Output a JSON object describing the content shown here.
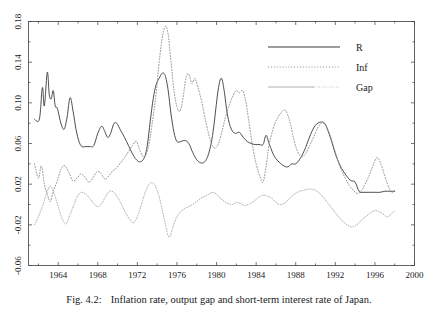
{
  "caption": {
    "number": "Fig. 4.2:",
    "text": "Inflation rate, output gap and short-term interest rate of Japan."
  },
  "legend": {
    "position": "top-right",
    "items": [
      {
        "label": "R",
        "style": "solid",
        "color": "#3a3a3a"
      },
      {
        "label": "Inf",
        "style": "dotted",
        "color": "#8c8c8c"
      },
      {
        "label": "Gap",
        "style": "solid-dotted",
        "color": "#b0b0b0"
      }
    ]
  },
  "chart_data": {
    "type": "line",
    "title": "",
    "xlabel": "",
    "ylabel": "",
    "xlim": [
      1961.0,
      2000.0
    ],
    "ylim": [
      -0.06,
      0.18
    ],
    "grid": false,
    "legend_position": "top-right",
    "xticks": [
      1964,
      1968,
      1972,
      1976,
      1980,
      1984,
      1988,
      1992,
      1996,
      2000
    ],
    "xtick_labels": [
      "1964",
      "1968",
      "1972",
      "1976",
      "1980",
      "1984",
      "1988",
      "1992",
      "1996",
      "2000"
    ],
    "yticks": [
      -0.06,
      -0.02,
      0.02,
      0.06,
      0.1,
      0.14,
      0.18
    ],
    "ytick_labels": [
      "-0.06",
      "-0.02",
      "0.02",
      "0.06",
      "0.10",
      "0.14",
      "0.18"
    ],
    "series": [
      {
        "name": "R",
        "style": "solid",
        "color": "#3a3a3a",
        "x": [
          1961.6,
          1962.1,
          1962.4,
          1962.6,
          1962.9,
          1963.1,
          1963.3,
          1963.5,
          1963.7,
          1963.9,
          1964.1,
          1964.3,
          1964.6,
          1964.9,
          1965.2,
          1965.5,
          1965.8,
          1966.1,
          1966.4,
          1966.8,
          1967.2,
          1967.6,
          1968.0,
          1968.4,
          1968.7,
          1969.0,
          1969.3,
          1969.6,
          1969.9,
          1970.3,
          1970.7,
          1971.1,
          1971.5,
          1971.9,
          1972.3,
          1972.7,
          1973.0,
          1973.3,
          1973.6,
          1973.9,
          1974.2,
          1974.5,
          1974.8,
          1975.1,
          1975.4,
          1975.7,
          1976.0,
          1976.4,
          1976.8,
          1977.2,
          1977.6,
          1978.0,
          1978.4,
          1978.8,
          1979.2,
          1979.6,
          1979.9,
          1980.2,
          1980.5,
          1980.8,
          1981.1,
          1981.5,
          1981.9,
          1982.3,
          1982.7,
          1983.1,
          1983.5,
          1983.9,
          1984.3,
          1984.7,
          1985.0,
          1985.3,
          1985.5,
          1985.7,
          1986.0,
          1986.4,
          1986.8,
          1987.2,
          1987.6,
          1988.0,
          1988.5,
          1989.0,
          1989.5,
          1990.0,
          1990.5,
          1990.9,
          1991.2,
          1991.6,
          1992.0,
          1992.5,
          1993.0,
          1993.5,
          1994.0,
          1994.4,
          1994.8,
          1995.2,
          1995.6,
          1996.0,
          1996.5,
          1997.0,
          1997.5,
          1998.0
        ],
        "y": [
          0.084,
          0.084,
          0.115,
          0.097,
          0.13,
          0.108,
          0.104,
          0.112,
          0.097,
          0.095,
          0.087,
          0.079,
          0.074,
          0.086,
          0.105,
          0.092,
          0.074,
          0.062,
          0.057,
          0.057,
          0.057,
          0.058,
          0.07,
          0.077,
          0.072,
          0.066,
          0.07,
          0.079,
          0.08,
          0.073,
          0.066,
          0.058,
          0.05,
          0.044,
          0.042,
          0.046,
          0.058,
          0.082,
          0.104,
          0.118,
          0.124,
          0.129,
          0.127,
          0.113,
          0.089,
          0.071,
          0.062,
          0.062,
          0.063,
          0.06,
          0.051,
          0.044,
          0.041,
          0.042,
          0.05,
          0.068,
          0.092,
          0.115,
          0.124,
          0.11,
          0.088,
          0.074,
          0.07,
          0.071,
          0.066,
          0.062,
          0.06,
          0.059,
          0.059,
          0.059,
          0.068,
          0.06,
          0.055,
          0.05,
          0.045,
          0.041,
          0.038,
          0.037,
          0.04,
          0.04,
          0.046,
          0.056,
          0.069,
          0.078,
          0.081,
          0.08,
          0.074,
          0.063,
          0.05,
          0.038,
          0.03,
          0.024,
          0.022,
          0.013,
          0.012,
          0.012,
          0.012,
          0.012,
          0.012,
          0.013,
          0.013,
          0.013
        ]
      },
      {
        "name": "Inf",
        "style": "dotted",
        "color": "#8c8c8c",
        "x": [
          1961.6,
          1962.0,
          1962.3,
          1962.6,
          1962.9,
          1963.2,
          1963.5,
          1963.9,
          1964.3,
          1964.7,
          1965.1,
          1965.5,
          1965.9,
          1966.3,
          1966.7,
          1967.1,
          1967.5,
          1967.9,
          1968.3,
          1968.7,
          1969.1,
          1969.5,
          1969.9,
          1970.3,
          1970.7,
          1971.1,
          1971.5,
          1971.9,
          1972.3,
          1972.7,
          1973.1,
          1973.5,
          1973.9,
          1974.2,
          1974.5,
          1974.8,
          1975.1,
          1975.4,
          1975.7,
          1976.0,
          1976.3,
          1976.6,
          1976.9,
          1977.2,
          1977.5,
          1977.8,
          1978.1,
          1978.5,
          1978.9,
          1979.3,
          1979.7,
          1980.1,
          1980.5,
          1980.9,
          1981.3,
          1981.7,
          1982.0,
          1982.3,
          1982.6,
          1982.9,
          1983.2,
          1983.6,
          1984.0,
          1984.4,
          1984.7,
          1985.0,
          1985.3,
          1985.7,
          1986.1,
          1986.5,
          1986.9,
          1987.2,
          1987.5,
          1987.8,
          1988.2,
          1988.6,
          1989.0,
          1989.4,
          1989.8,
          1990.2,
          1990.6,
          1991.0,
          1991.4,
          1991.8,
          1992.2,
          1992.6,
          1993.0,
          1993.4,
          1993.8,
          1994.2,
          1994.6,
          1995.0,
          1995.4,
          1995.8,
          1996.2,
          1996.6,
          1997.0,
          1997.4,
          1997.7,
          1998.0
        ],
        "y": [
          0.04,
          0.026,
          0.038,
          0.02,
          0.01,
          0.003,
          0.013,
          0.023,
          0.035,
          0.038,
          0.031,
          0.023,
          0.026,
          0.03,
          0.027,
          0.022,
          0.026,
          0.032,
          0.031,
          0.025,
          0.028,
          0.033,
          0.036,
          0.041,
          0.046,
          0.052,
          0.058,
          0.062,
          0.052,
          0.047,
          0.056,
          0.08,
          0.11,
          0.14,
          0.163,
          0.175,
          0.168,
          0.14,
          0.112,
          0.096,
          0.092,
          0.104,
          0.124,
          0.128,
          0.119,
          0.124,
          0.116,
          0.101,
          0.082,
          0.066,
          0.056,
          0.058,
          0.07,
          0.086,
          0.098,
          0.108,
          0.112,
          0.11,
          0.112,
          0.104,
          0.086,
          0.06,
          0.04,
          0.027,
          0.022,
          0.037,
          0.058,
          0.074,
          0.084,
          0.09,
          0.093,
          0.088,
          0.078,
          0.064,
          0.052,
          0.047,
          0.05,
          0.058,
          0.066,
          0.075,
          0.08,
          0.078,
          0.07,
          0.058,
          0.045,
          0.034,
          0.026,
          0.019,
          0.014,
          0.011,
          0.013,
          0.02,
          0.028,
          0.038,
          0.046,
          0.04,
          0.028,
          0.017,
          0.012,
          0.014
        ]
      },
      {
        "name": "Gap",
        "style": "dotted",
        "color": "#b0b0b0",
        "x": [
          1961.6,
          1962.0,
          1962.4,
          1962.8,
          1963.2,
          1963.6,
          1964.0,
          1964.4,
          1964.8,
          1965.2,
          1965.6,
          1966.0,
          1966.4,
          1966.8,
          1967.2,
          1967.6,
          1968.0,
          1968.4,
          1968.8,
          1969.2,
          1969.6,
          1970.0,
          1970.4,
          1970.8,
          1971.2,
          1971.6,
          1972.0,
          1972.4,
          1972.8,
          1973.2,
          1973.6,
          1974.0,
          1974.4,
          1974.8,
          1975.2,
          1975.6,
          1976.0,
          1976.4,
          1976.8,
          1977.2,
          1977.6,
          1978.0,
          1978.4,
          1978.8,
          1979.2,
          1979.6,
          1980.0,
          1980.4,
          1980.8,
          1981.2,
          1981.6,
          1982.0,
          1982.4,
          1982.8,
          1983.2,
          1983.6,
          1984.0,
          1984.4,
          1984.8,
          1985.2,
          1985.6,
          1986.0,
          1986.4,
          1986.8,
          1987.2,
          1987.6,
          1988.0,
          1988.4,
          1988.8,
          1989.2,
          1989.6,
          1990.0,
          1990.4,
          1990.8,
          1991.2,
          1991.6,
          1992.0,
          1992.4,
          1992.8,
          1993.2,
          1993.6,
          1994.0,
          1994.4,
          1994.8,
          1995.2,
          1995.6,
          1996.0,
          1996.4,
          1996.8,
          1997.2,
          1997.6,
          1998.0
        ],
        "y": [
          -0.02,
          -0.012,
          -0.002,
          0.01,
          0.018,
          0.01,
          -0.002,
          -0.014,
          -0.019,
          -0.01,
          0.0,
          0.009,
          0.012,
          0.01,
          0.006,
          0.001,
          -0.002,
          0.001,
          0.008,
          0.013,
          0.012,
          0.007,
          0.0,
          -0.008,
          -0.014,
          -0.018,
          -0.012,
          0.0,
          0.012,
          0.02,
          0.021,
          0.014,
          0.0,
          -0.018,
          -0.032,
          -0.022,
          -0.012,
          -0.007,
          -0.004,
          -0.002,
          0.0,
          0.003,
          0.006,
          0.008,
          0.01,
          0.012,
          0.01,
          0.006,
          0.003,
          0.001,
          0.0,
          0.002,
          0.001,
          -0.001,
          0.0,
          0.002,
          0.005,
          0.008,
          0.009,
          0.008,
          0.006,
          0.002,
          0.0,
          0.001,
          0.004,
          0.008,
          0.011,
          0.013,
          0.014,
          0.015,
          0.015,
          0.014,
          0.011,
          0.007,
          0.002,
          -0.003,
          -0.008,
          -0.013,
          -0.017,
          -0.02,
          -0.022,
          -0.021,
          -0.018,
          -0.014,
          -0.011,
          -0.008,
          -0.006,
          -0.007,
          -0.009,
          -0.012,
          -0.01,
          -0.006
        ]
      }
    ]
  }
}
